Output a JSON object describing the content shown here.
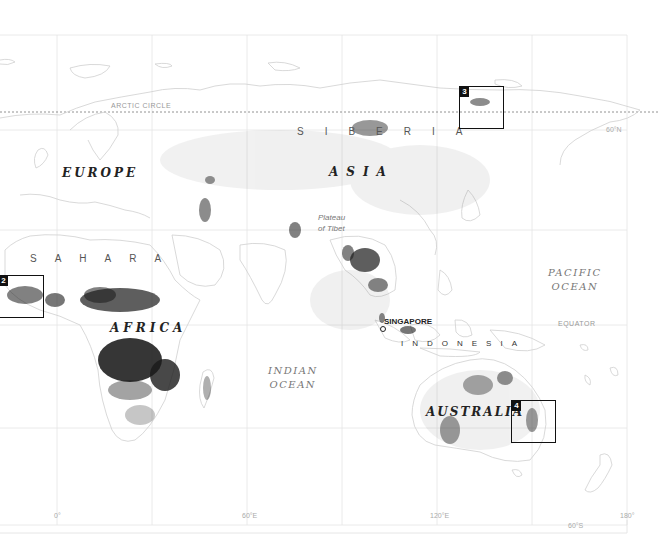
{
  "map": {
    "lines": {
      "arctic_circle": "ARCTIC CIRCLE",
      "equator": "EQUATOR"
    },
    "regions": {
      "europe": "EUROPE",
      "asia": "ASIA",
      "siberia": "SIBERIA",
      "sahara": "SAHARA",
      "africa": "AFRICA",
      "indonesia": "INDONESIA",
      "australia": "AUSTRALIA"
    },
    "oceans": {
      "pacific_line1": "PACIFIC",
      "pacific_line2": "OCEAN",
      "indian_line1": "INDIAN",
      "indian_line2": "OCEAN"
    },
    "places": {
      "singapore": "SINGAPORE",
      "tibet_line1": "Plateau",
      "tibet_line2": "of Tibet"
    },
    "ticks": {
      "lon_0": "0°",
      "lon_60e": "60°E",
      "lon_120e": "120°E",
      "lon_180": "180°",
      "lat_60n": "60°N",
      "lat_60s": "60°S"
    },
    "insets": [
      {
        "number": "2"
      },
      {
        "number": "3"
      },
      {
        "number": "4"
      }
    ],
    "colors": {
      "density_dark": "#1a1a1a",
      "grid": "#e2e2e2",
      "coast": "#cfcfcf",
      "inset_border": "#111111"
    }
  }
}
